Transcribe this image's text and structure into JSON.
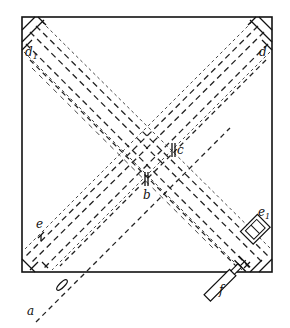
{
  "figure": {
    "type": "optical interferometer schematic (crossed beam paths in square frame)",
    "labels": {
      "a": "a",
      "b": "b",
      "c": "c",
      "d": "d",
      "d1": "d",
      "d1_sub": "1",
      "e": "e",
      "e1": "e",
      "e1_sub": "1",
      "f": "f"
    },
    "colors": {
      "ink": "#111111",
      "paper": "#ffffff"
    }
  }
}
